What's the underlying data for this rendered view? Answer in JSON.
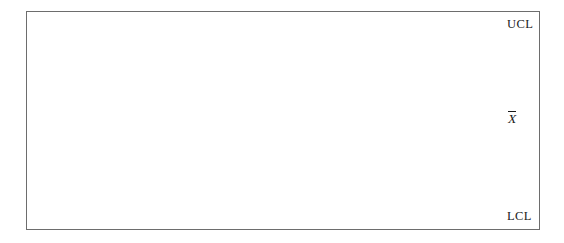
{
  "chart_data": {
    "type": "line",
    "title": "",
    "subtitle": "",
    "xlabel": "",
    "ylabel": "",
    "grid": false,
    "legend_position": "right",
    "x": [
      1,
      2,
      3,
      4,
      5,
      6,
      7,
      8,
      9,
      10,
      11,
      12,
      13,
      14,
      15,
      16,
      17,
      18
    ],
    "series": [
      {
        "name": "Sample mean",
        "marker": "filled-circle",
        "values": [
          -2.1,
          0.02,
          -0.32,
          0.6,
          -0.92,
          0.96,
          1.52,
          1.6,
          0.45,
          -0.44,
          -2.85,
          -0.48,
          1.05,
          -1.28,
          0.58,
          1.6,
          0.9,
          -0.24
        ]
      }
    ],
    "reference_lines": [
      {
        "id": "ucl",
        "label": "UCL",
        "value": 3.0,
        "style": "dashed",
        "color": "#3c3c3c"
      },
      {
        "id": "center",
        "label": "X̄",
        "value": 0.0,
        "style": "solid",
        "color": "#6d6d6d"
      },
      {
        "id": "lcl",
        "label": "LCL",
        "value": -3.0,
        "style": "dashed",
        "color": "#3c3c3c"
      }
    ],
    "ylim": [
      -3.6,
      3.6
    ],
    "xlim": [
      0.4,
      18.8
    ],
    "pixel_points": [
      {
        "x": 54,
        "y": 177
      },
      {
        "x": 75,
        "y": 120
      },
      {
        "x": 97,
        "y": 131
      },
      {
        "x": 118,
        "y": 105
      },
      {
        "x": 140,
        "y": 148
      },
      {
        "x": 162,
        "y": 92
      },
      {
        "x": 175,
        "y": 77
      },
      {
        "x": 186,
        "y": 76
      },
      {
        "x": 208,
        "y": 110
      },
      {
        "x": 229,
        "y": 139
      },
      {
        "x": 250,
        "y": 199
      },
      {
        "x": 272,
        "y": 140
      },
      {
        "x": 293,
        "y": 93
      },
      {
        "x": 315,
        "y": 162
      },
      {
        "x": 337,
        "y": 108
      },
      {
        "x": 358,
        "y": 76
      },
      {
        "x": 380,
        "y": 93
      },
      {
        "x": 405,
        "y": 131
      }
    ]
  },
  "labels": {
    "ucl": "UCL",
    "lcl": "LCL",
    "center_line": "X"
  },
  "colors": {
    "frame": "#6d6d6d",
    "center_line": "#6d6d6d",
    "control_limit": "#3c3c3c",
    "data_line": "#2a2a2a",
    "marker": "#101010",
    "background": "#ffffff",
    "text": "#1a1a1a"
  },
  "geometry": {
    "frame": {
      "x": 26,
      "y": 11,
      "width": 514,
      "height": 219
    },
    "ucl_line": {
      "x1": 38,
      "y1": 24,
      "x2": 503,
      "y2": 24
    },
    "lcl_line": {
      "x1": 38,
      "y1": 216,
      "x2": 503,
      "y2": 216
    },
    "center_line": {
      "x1": 32,
      "y1": 123,
      "x2": 506,
      "y2": 119
    }
  }
}
